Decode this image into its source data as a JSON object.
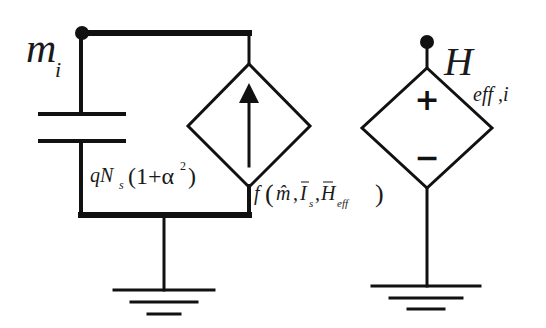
{
  "diagram": {
    "type": "equivalent-circuit",
    "colors": {
      "stroke": "#111111",
      "background": "#ffffff"
    },
    "nodes": [
      {
        "id": "node-m",
        "label": "m",
        "subscript": "i"
      },
      {
        "id": "node-h",
        "label": "H",
        "subscript": "eff ,i"
      }
    ],
    "components": {
      "capacitor": {
        "label_prefix": "qN",
        "label_sub": "s",
        "label_open": "(1+α",
        "label_sup": "2",
        "label_close": ")"
      },
      "dependent_current_source": {
        "symbol": "arrow-up",
        "label_func": "f",
        "label_open": "(",
        "arg1": "m̂",
        "sep1": ",",
        "arg2": "I",
        "arg2_sub": "s",
        "sep2": ",",
        "arg3": "H",
        "arg3_sub": "eff",
        "label_close": ")"
      },
      "dependent_voltage_source": {
        "plus": "+",
        "minus": "−"
      }
    },
    "grounds": [
      {
        "id": "ground-left"
      },
      {
        "id": "ground-right"
      }
    ]
  }
}
